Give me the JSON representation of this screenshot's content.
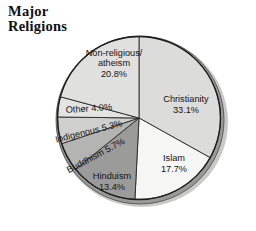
{
  "title": "Major\nReligions",
  "chart_data": {
    "type": "pie",
    "title": "Major Religions",
    "xlabel": "",
    "ylabel": "",
    "units": "percent",
    "start_angle_deg": 0,
    "direction": "clockwise",
    "legend": "none (labels inside slices)",
    "grid": false,
    "categories": [
      "Christianity",
      "Islam",
      "Hinduism",
      "Buddhism",
      "Indigenous",
      "Other",
      "Non-religious/atheism"
    ],
    "values": [
      33.1,
      17.7,
      13.4,
      5.7,
      5.3,
      4.0,
      20.8
    ],
    "slices": [
      {
        "name": "Christianity",
        "label": "Christianity",
        "value_label": "33.1%",
        "value": 33.1,
        "color": "#dcdcda",
        "label_rotation": 0
      },
      {
        "name": "Islam",
        "label": "Islam",
        "value_label": "17.7%",
        "value": 17.7,
        "color": "#f6f6f4",
        "label_rotation": 0
      },
      {
        "name": "Hinduism",
        "label": "Hinduism",
        "value_label": "13.4%",
        "value": 13.4,
        "color": "#9b9b99",
        "label_rotation": 0
      },
      {
        "name": "Buddhism",
        "label": "Buddhism 5.7%",
        "value_label": "5.7%",
        "value": 5.7,
        "color": "#b4b4b2",
        "label_rotation": -28
      },
      {
        "name": "Indigenous",
        "label": "Indigenous 5.3%",
        "value_label": "5.3%",
        "value": 5.3,
        "color": "#cfcfcd",
        "label_rotation": -14
      },
      {
        "name": "Other",
        "label": "Other 4.0%",
        "value_label": "4.0%",
        "value": 4.0,
        "color": "#e4e4e2",
        "label_rotation": -4
      },
      {
        "name": "Non-religious",
        "label": "Non-religious/\natheism",
        "label_line1": "Non-religious/",
        "label_line2": "atheism",
        "value_label": "20.8%",
        "value": 20.8,
        "color": "#e0e0de",
        "label_rotation": 0
      }
    ],
    "total": 100.0,
    "style": {
      "outline_color": "#1d1d1d",
      "rim_color": "#8f8f8d",
      "shadow_color": "#c9c9c7",
      "background": "#ffffff"
    }
  }
}
